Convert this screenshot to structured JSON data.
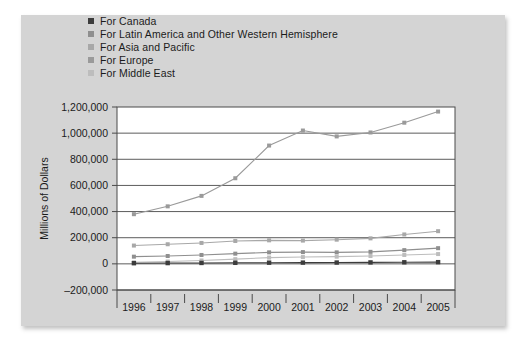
{
  "legend": {
    "position": "top-left",
    "items": [
      {
        "label": "For Canada",
        "color": "#3c3c3c"
      },
      {
        "label": "For Latin America and Other Western Hemisphere",
        "color": "#8f8f8f"
      },
      {
        "label": "For Asia and Pacific",
        "color": "#a8a8a8"
      },
      {
        "label": "For Europe",
        "color": "#9a9a9a"
      },
      {
        "label": "For Middle East",
        "color": "#bdbdbd"
      }
    ]
  },
  "chart_data": {
    "type": "line",
    "title": "",
    "xlabel": "",
    "ylabel": "Millions of Dollars",
    "categories": [
      "1996",
      "1997",
      "1998",
      "1999",
      "2000",
      "2001",
      "2002",
      "2003",
      "2004",
      "2005"
    ],
    "ylim": [
      -200000,
      1200000
    ],
    "ytick_values": [
      -200000,
      0,
      200000,
      400000,
      600000,
      800000,
      1000000,
      1200000
    ],
    "ytick_labels": [
      "–200,000",
      "0",
      "200,000",
      "400,000",
      "600,000",
      "800,000",
      "1,000,000",
      "1,200,000"
    ],
    "grid": true,
    "legend_position": "top-left",
    "series": [
      {
        "name": "For Europe",
        "color": "#9a9a9a",
        "values": [
          380000,
          440000,
          520000,
          655000,
          905000,
          1020000,
          975000,
          1005000,
          1080000,
          1165000
        ]
      },
      {
        "name": "For Asia and Pacific",
        "color": "#a8a8a8",
        "values": [
          140000,
          150000,
          160000,
          175000,
          180000,
          178000,
          185000,
          195000,
          225000,
          250000
        ]
      },
      {
        "name": "For Latin America and Other Western Hemisphere",
        "color": "#8f8f8f",
        "values": [
          55000,
          60000,
          68000,
          78000,
          88000,
          90000,
          88000,
          92000,
          105000,
          120000
        ]
      },
      {
        "name": "For Middle East",
        "color": "#bdbdbd",
        "values": [
          12000,
          18000,
          26000,
          36000,
          48000,
          52000,
          55000,
          60000,
          68000,
          75000
        ]
      },
      {
        "name": "For Canada",
        "color": "#3c3c3c",
        "values": [
          5000,
          6000,
          7000,
          8000,
          9000,
          9500,
          10000,
          11000,
          12000,
          13000
        ]
      }
    ]
  }
}
